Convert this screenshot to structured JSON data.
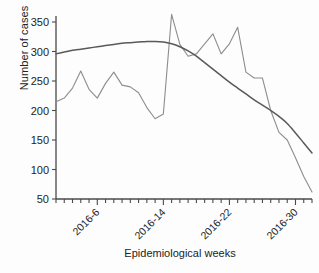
{
  "figure": {
    "ylabel": "Number of cases",
    "xlabel": "Epidemiological weeks"
  },
  "axes": {
    "y_ticks": [
      "350",
      "300",
      "250",
      "200",
      "150",
      "100",
      "50"
    ],
    "x_ticks": [
      "2016-6",
      "2016-14",
      "2016-22",
      "2016-30"
    ]
  },
  "colors": {
    "observed": "#8d8d8d",
    "trend": "#595959",
    "axis": "#4a4a4a",
    "text": "#232323",
    "background": "#fdfdfd"
  },
  "chart_data": {
    "type": "line",
    "title": "",
    "subtitle": "",
    "xlabel": "Epidemiological weeks",
    "ylabel": "Number of cases",
    "xlim": [
      1,
      32
    ],
    "ylim": [
      50,
      370
    ],
    "yticks": [
      50,
      100,
      150,
      200,
      250,
      300,
      350
    ],
    "xtick_labels": [
      "2016-6",
      "2016-14",
      "2016-22",
      "2016-30"
    ],
    "xtick_positions": [
      6,
      14,
      22,
      30
    ],
    "grid": false,
    "legend": "none",
    "x": [
      1,
      2,
      3,
      4,
      5,
      6,
      7,
      8,
      9,
      10,
      11,
      12,
      13,
      14,
      15,
      16,
      17,
      18,
      19,
      20,
      21,
      22,
      23,
      24,
      25,
      26,
      27,
      28,
      29,
      30,
      31,
      32
    ],
    "series": [
      {
        "name": "Observed cases",
        "color": "#8d8d8d",
        "style": "jagged",
        "values": [
          215,
          221,
          238,
          267,
          236,
          221,
          246,
          265,
          243,
          240,
          230,
          205,
          186,
          194,
          363,
          312,
          292,
          296,
          313,
          330,
          296,
          313,
          341,
          265,
          255,
          255,
          200,
          163,
          150,
          120,
          88,
          62
        ]
      },
      {
        "name": "Fitted trend",
        "color": "#595959",
        "style": "smooth",
        "values": [
          296,
          299,
          302,
          304,
          306,
          308,
          310,
          312,
          314,
          315,
          316,
          317,
          317,
          316,
          313,
          308,
          301,
          292,
          281,
          270,
          259,
          248,
          238,
          228,
          218,
          209,
          200,
          190,
          178,
          162,
          145,
          128
        ]
      }
    ]
  }
}
